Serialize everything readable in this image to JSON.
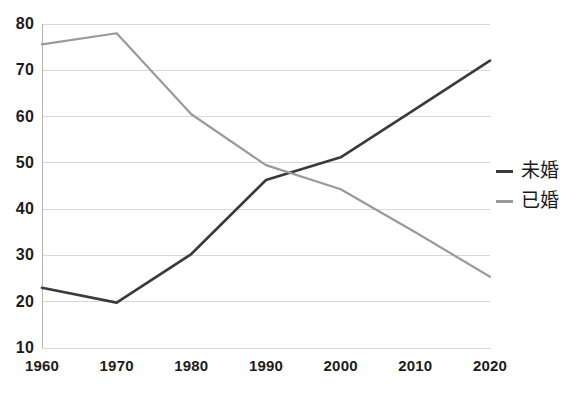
{
  "chart_data": {
    "type": "line",
    "title": "",
    "xlabel": "",
    "ylabel": "",
    "categories": [
      1960,
      1970,
      1980,
      1990,
      2000,
      2010,
      2020
    ],
    "xtick_labels": [
      "1960",
      "1970",
      "1980",
      "1990",
      "2000",
      "2010",
      "2020"
    ],
    "ytick_labels": [
      "10",
      "20",
      "30",
      "40",
      "50",
      "60",
      "70",
      "80"
    ],
    "ytick_values": [
      10,
      20,
      30,
      40,
      50,
      60,
      70,
      80
    ],
    "ylim": [
      10,
      80
    ],
    "xlim": [
      1960,
      2020
    ],
    "grid": true,
    "legend_position": "right",
    "series": [
      {
        "name": "未婚",
        "color": "#3a3a3a",
        "values": [
          23,
          19.8,
          30.3,
          46.3,
          51.2,
          61.6,
          72.1
        ]
      },
      {
        "name": "已婚",
        "color": "#9a9a9a",
        "values": [
          75.6,
          78,
          60.5,
          49.5,
          44.3,
          35,
          25.4
        ]
      }
    ]
  },
  "legend": {
    "items": [
      {
        "label": "未婚",
        "marker": "dash-dark"
      },
      {
        "label": "已婚",
        "marker": "dash-gray"
      }
    ]
  },
  "colors": {
    "series_unmarried": "#3a3a3a",
    "series_married": "#9a9a9a",
    "gridline": "#d8d8d8",
    "axis": "#b4b4b4",
    "text": "#1c1c1c",
    "background": "#ffffff"
  }
}
